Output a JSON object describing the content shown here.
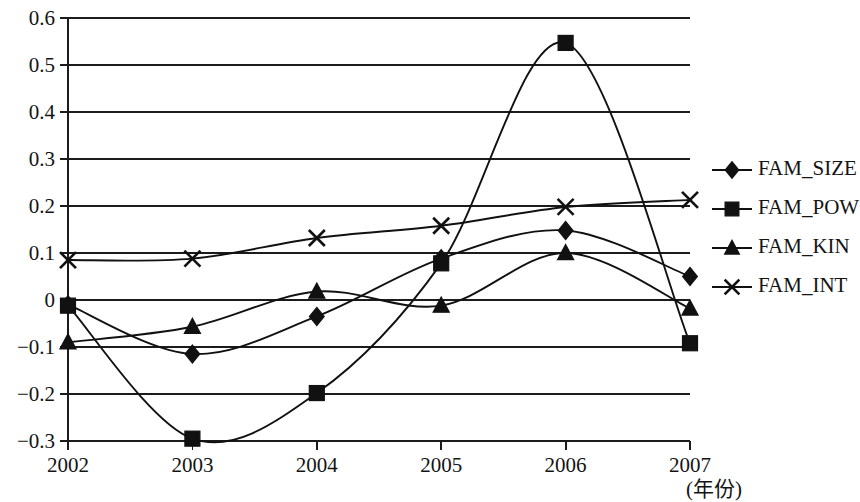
{
  "chart_data": {
    "type": "line",
    "title": "",
    "xlabel": "(年份)",
    "ylabel": "",
    "x": [
      2002,
      2003,
      2004,
      2005,
      2006,
      2007
    ],
    "categories": [
      "2002",
      "2003",
      "2004",
      "2005",
      "2006",
      "2007"
    ],
    "xtick_labels": [
      "2002",
      "2003",
      "2004",
      "2005",
      "2006",
      "2007"
    ],
    "ytick_labels": [
      "0.6",
      "0.5",
      "0.4",
      "0.3",
      "0.2",
      "0.1",
      "0",
      "−0.1",
      "−0.2",
      "−0.3"
    ],
    "ytick_values": [
      0.6,
      0.5,
      0.4,
      0.3,
      0.2,
      0.1,
      0,
      -0.1,
      -0.2,
      -0.3
    ],
    "ylim": [
      -0.3,
      0.6
    ],
    "xlim": [
      2002,
      2007
    ],
    "grid": true,
    "smooth": true,
    "legend_position": "right",
    "series": [
      {
        "name": "FAM_SIZE",
        "marker": "diamond",
        "values": [
          -0.01,
          -0.115,
          -0.035,
          0.088,
          0.148,
          0.05
        ]
      },
      {
        "name": "FAM_POW",
        "marker": "square",
        "values": [
          -0.012,
          -0.295,
          -0.198,
          0.078,
          0.547,
          -0.092
        ]
      },
      {
        "name": "FAM_KIN",
        "marker": "triangle",
        "values": [
          -0.09,
          -0.057,
          0.018,
          -0.012,
          0.1,
          -0.018
        ]
      },
      {
        "name": "FAM_INT",
        "marker": "cross",
        "values": [
          0.085,
          0.088,
          0.132,
          0.158,
          0.198,
          0.213
        ]
      }
    ]
  },
  "legend": {
    "entries": [
      {
        "label": "FAM_SIZE"
      },
      {
        "label": "FAM_POW"
      },
      {
        "label": "FAM_KIN"
      },
      {
        "label": "FAM_INT"
      }
    ]
  },
  "axes": {
    "x_caption": "(年份)"
  }
}
